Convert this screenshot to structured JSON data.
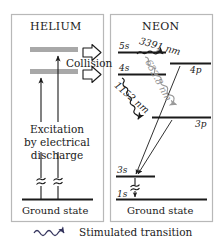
{
  "diagram": {
    "title_helium": "HELIUM",
    "title_neon": "NEON",
    "collision_label": "Collision",
    "excitation_text_line1": "Excitation",
    "excitation_text_line2": "by electrical",
    "excitation_text_line3": "discharge",
    "ground_state_helium": "Ground state",
    "ground_state_neon": "Ground state",
    "legend_label": "Stimulated transition",
    "colors": {
      "helium_level": "#a8a8a8",
      "line": "#1a1a1a",
      "box_border": "#b4b4b4",
      "grey_label": "#8e8e8e"
    },
    "neon_levels": [
      {
        "name": "5s",
        "label": "5s"
      },
      {
        "name": "4s",
        "label": "4s"
      },
      {
        "name": "4p",
        "label": "4p"
      },
      {
        "name": "3p",
        "label": "3p"
      },
      {
        "name": "3s",
        "label": "3s"
      },
      {
        "name": "1s",
        "label": "1s"
      }
    ],
    "transitions": [
      {
        "name": "3391",
        "label": "3391 nm",
        "from": "5s",
        "to": "4p",
        "stimulated": true
      },
      {
        "name": "632",
        "label": "632.8 nm",
        "from": "5s",
        "to": "3p",
        "stimulated": true
      },
      {
        "name": "1152",
        "label": "1152 nm",
        "from": "4s",
        "to": "3p",
        "stimulated": true
      }
    ]
  }
}
